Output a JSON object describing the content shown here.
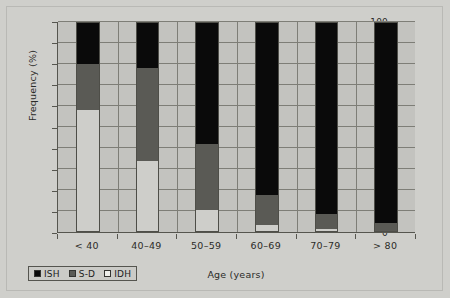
{
  "chart_data": {
    "type": "bar",
    "subtype": "stacked-100-percent",
    "title": "",
    "xlabel": "Age (years)",
    "ylabel": "Frequency (%)",
    "categories": [
      "< 40",
      "40–49",
      "50–59",
      "60–69",
      "70–79",
      "> 80"
    ],
    "ylim": [
      0,
      100
    ],
    "yticks": [
      0,
      10,
      20,
      30,
      40,
      50,
      60,
      70,
      80,
      90,
      100
    ],
    "ytick_labels": [
      "0",
      "10",
      "20",
      "30",
      "40",
      "50",
      "60",
      "70",
      "80",
      "90",
      "100"
    ],
    "grid": true,
    "legend_position": "bottom-left",
    "series": [
      {
        "name": "ISH",
        "color": "#0a0a0a",
        "values": [
          20,
          22,
          58,
          82.5,
          91.5,
          95.5
        ]
      },
      {
        "name": "S-D",
        "color": "#5a5a55",
        "values": [
          22,
          44,
          31.5,
          14,
          7,
          4.5
        ]
      },
      {
        "name": "IDH",
        "color": "#cececa",
        "values": [
          58,
          34,
          10.5,
          3.5,
          1.5,
          0
        ]
      }
    ],
    "cumulative_tops": {
      "IDH": [
        58,
        34,
        10.5,
        3.5,
        1.5,
        0
      ],
      "S-D": [
        80,
        78,
        42,
        17.5,
        8.5,
        4.5
      ],
      "ISH": [
        100,
        100,
        100,
        100,
        100,
        100
      ]
    }
  },
  "legend": {
    "items": [
      {
        "label": "ISH",
        "swatch": "black-square-icon",
        "color": "#0a0a0a"
      },
      {
        "label": "S-D",
        "swatch": "gray-square-icon",
        "color": "#5a5a55"
      },
      {
        "label": "IDH",
        "swatch": "white-square-icon",
        "color": "#eeeeea"
      }
    ]
  },
  "colors": {
    "figure_background": "#cfcfcb",
    "plot_background": "#c3c3bf",
    "gridline": "#7e7e77",
    "axis": "#56564f",
    "text": "#2b2b28"
  }
}
